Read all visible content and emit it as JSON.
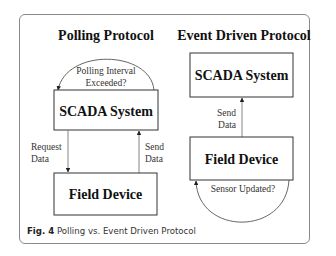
{
  "figure": {
    "caption_label": "Fig. 4",
    "caption_text": " Polling vs. Event Driven Protocol"
  },
  "polling": {
    "title": "Polling Protocol",
    "top_box": "SCADA System",
    "bottom_box": "Field Device",
    "loop_label_line1": "Polling Interval",
    "loop_label_line2": "Exceeded?",
    "down_arrow_line1": "Request",
    "down_arrow_line2": "Data",
    "up_arrow_line1": "Send",
    "up_arrow_line2": "Data"
  },
  "event": {
    "title": "Event Driven Protocol",
    "top_box": "SCADA System",
    "bottom_box": "Field Device",
    "loop_label": "Sensor Updated?",
    "up_arrow_line1": "Send",
    "up_arrow_line2": "Data"
  },
  "colors": {
    "stroke": "#333333",
    "arrow_gray": "#666666",
    "frame": "#8a8a8a",
    "text": "#111111"
  }
}
